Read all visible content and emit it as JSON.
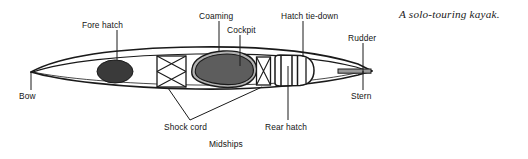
{
  "figure": {
    "caption": "A solo-touring kayak."
  },
  "labels": {
    "fore_hatch": "Fore hatch",
    "coaming": "Coaming",
    "cockpit": "Cockpit",
    "hatch_tie_down": "Hatch tie-down",
    "rudder": "Rudder",
    "bow": "Bow",
    "stern": "Stern",
    "shock_cord": "Shock cord",
    "rear_hatch": "Rear hatch",
    "midships": "Midships"
  },
  "colors": {
    "hull_outline": "#1a1a1a",
    "deck_line": "#1a1a1a",
    "fore_hatch_fill": "#3a3a3a",
    "cockpit_fill": "#5d5d5d",
    "coaming_fill": "#b3b3b3",
    "rudder_fill": "#9a9a9a",
    "background": "#ffffff",
    "text": "#141414"
  },
  "parts": [
    {
      "name": "bow",
      "label": "Bow",
      "side": "left-tip"
    },
    {
      "name": "fore-hatch",
      "label": "Fore hatch",
      "shape": "dark ellipse"
    },
    {
      "name": "forward-shock-cord",
      "label": "Shock cord",
      "shape": "rectangle with crossed cords"
    },
    {
      "name": "coaming",
      "label": "Coaming",
      "shape": "light gray rim around cockpit"
    },
    {
      "name": "cockpit",
      "label": "Cockpit",
      "shape": "dark teardrop opening"
    },
    {
      "name": "rear-shock-cord",
      "label": "Shock cord",
      "shape": "rectangle with crossed cords"
    },
    {
      "name": "rear-hatch",
      "label": "Rear hatch",
      "shape": "rounded rectangle cover"
    },
    {
      "name": "hatch-tie-down",
      "label": "Hatch tie-down",
      "shape": "vertical straps over rear hatch"
    },
    {
      "name": "rudder",
      "label": "Rudder",
      "shape": "horizontal blade at stern"
    },
    {
      "name": "stern",
      "label": "Stern",
      "side": "right-tip"
    },
    {
      "name": "midships",
      "label": "Midships",
      "side": "center-bottom"
    }
  ]
}
